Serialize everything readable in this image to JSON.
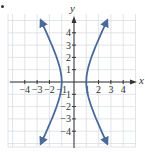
{
  "chart_data": {
    "type": "line",
    "title": "",
    "equation": "x^2 - y^2/4 = 1",
    "xlabel": "x",
    "ylabel": "y",
    "xlim": [
      -5,
      5
    ],
    "ylim": [
      -5,
      5
    ],
    "grid": true,
    "x_tick_labels": [
      "-4",
      "-3",
      "-2",
      "-1",
      "2",
      "3",
      "4"
    ],
    "x_ticks": [
      -4,
      -3,
      -2,
      -1,
      2,
      3,
      4
    ],
    "y_tick_labels": [
      "4",
      "3",
      "2",
      "1",
      "-1",
      "-2",
      "-3",
      "-4"
    ],
    "y_ticks": [
      4,
      3,
      2,
      1,
      -1,
      -2,
      -3,
      -4
    ],
    "origin_tick_label_x1": "1",
    "series": [
      {
        "name": "right branch",
        "color": "#4a6a9a",
        "points": [
          [
            2.69,
            -5
          ],
          [
            2.24,
            -4
          ],
          [
            1.8,
            -3
          ],
          [
            1.41,
            -2
          ],
          [
            1.12,
            -1
          ],
          [
            1.0,
            0
          ],
          [
            1.12,
            1
          ],
          [
            1.41,
            2
          ],
          [
            1.8,
            3
          ],
          [
            2.24,
            4
          ],
          [
            2.69,
            5
          ]
        ]
      },
      {
        "name": "left branch",
        "color": "#4a6a9a",
        "points": [
          [
            -2.69,
            -5
          ],
          [
            -2.24,
            -4
          ],
          [
            -1.8,
            -3
          ],
          [
            -1.41,
            -2
          ],
          [
            -1.12,
            -1
          ],
          [
            -1.0,
            0
          ],
          [
            -1.12,
            1
          ],
          [
            -1.41,
            2
          ],
          [
            -1.8,
            3
          ],
          [
            -2.24,
            4
          ],
          [
            -2.69,
            5
          ]
        ]
      }
    ],
    "vertices": [
      [
        -1,
        0
      ],
      [
        1,
        0
      ]
    ],
    "arrows_at_ends": true
  },
  "colors": {
    "curve": "#4a6a9a",
    "grid": "#d9dde3",
    "axis": "#333333",
    "text": "#333333"
  }
}
